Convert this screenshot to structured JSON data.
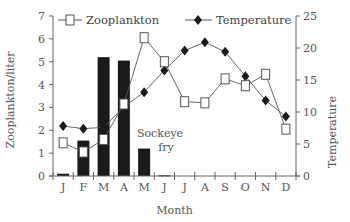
{
  "chart_data": {
    "type": "bar+line",
    "title": "",
    "xlabel": "Month",
    "ylabel": "Zooplankton/liter",
    "ylabel_right": "Temperature",
    "categories": [
      "J",
      "F",
      "M",
      "A",
      "M",
      "J",
      "J",
      "A",
      "S",
      "O",
      "N",
      "D"
    ],
    "ylim": [
      0,
      7
    ],
    "ylim_right": [
      0,
      25
    ],
    "yticks": [
      0,
      1,
      2,
      3,
      4,
      5,
      6,
      7
    ],
    "yticks_right": [
      0,
      5,
      10,
      15,
      20,
      25
    ],
    "grid": false,
    "legend_position": "top",
    "series": [
      {
        "name": "Sockeye fry",
        "type": "bar",
        "axis": "left",
        "values": [
          0.1,
          1.55,
          5.2,
          5.05,
          1.2,
          0.03,
          0,
          0,
          0,
          0,
          0,
          0
        ]
      },
      {
        "name": "Zooplankton",
        "type": "line",
        "marker": "open-square",
        "axis": "left",
        "values": [
          1.45,
          1.05,
          1.6,
          3.15,
          6.05,
          5.0,
          3.25,
          3.2,
          4.25,
          3.95,
          4.45,
          2.05
        ]
      },
      {
        "name": "Temperature",
        "type": "line",
        "marker": "filled-diamond",
        "axis": "right",
        "values": [
          7.8,
          7.4,
          7.6,
          10.8,
          13.1,
          16.5,
          19.6,
          20.9,
          19.4,
          15.6,
          11.8,
          9.3
        ]
      }
    ],
    "annotations": [
      {
        "text_line1": "Sockeye",
        "text_line2": "fry"
      }
    ]
  },
  "legend": {
    "zooplankton": "Zooplankton",
    "temperature": "Temperature"
  },
  "annotation": {
    "line1": "Sockeye",
    "line2": "fry"
  },
  "axes": {
    "x_title": "Month",
    "y_left_title": "Zooplankton/liter",
    "y_right_title": "Temperature"
  },
  "colors": {
    "bar": "#1a1a1a",
    "line": "#555555",
    "axis": "#666666"
  }
}
